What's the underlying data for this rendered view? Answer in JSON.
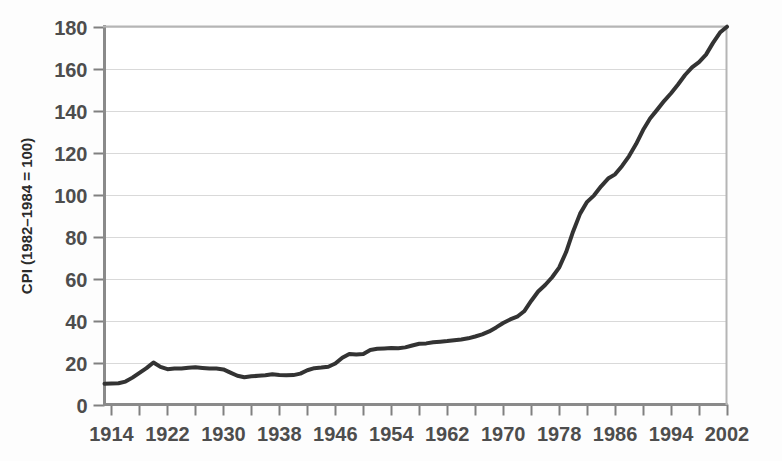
{
  "chart_data": {
    "type": "line",
    "title": "",
    "subtitle": "",
    "xlabel": "",
    "ylabel": "CPI (1982–1984 = 100)",
    "xlim": [
      1913,
      2002
    ],
    "ylim": [
      0,
      180
    ],
    "ytick_step": 20,
    "xtick_step_minor": 4,
    "xtick_step_major": 8,
    "grid": "horizontal",
    "legend": "none",
    "line_color": "#333333",
    "grid_color": "#d9d9d9",
    "axis_color": "#808080",
    "tick_labels": {
      "y": [
        "0",
        "20",
        "40",
        "60",
        "80",
        "100",
        "120",
        "140",
        "160",
        "180"
      ],
      "x": [
        "1914",
        "1922",
        "1930",
        "1938",
        "1946",
        "1954",
        "1962",
        "1970",
        "1978",
        "1986",
        "1994",
        "2002"
      ]
    },
    "x": [
      1913,
      1914,
      1915,
      1916,
      1917,
      1918,
      1919,
      1920,
      1921,
      1922,
      1923,
      1924,
      1925,
      1926,
      1927,
      1928,
      1929,
      1930,
      1931,
      1932,
      1933,
      1934,
      1935,
      1936,
      1937,
      1938,
      1939,
      1940,
      1941,
      1942,
      1943,
      1944,
      1945,
      1946,
      1947,
      1948,
      1949,
      1950,
      1951,
      1952,
      1953,
      1954,
      1955,
      1956,
      1957,
      1958,
      1959,
      1960,
      1961,
      1962,
      1963,
      1964,
      1965,
      1966,
      1967,
      1968,
      1969,
      1970,
      1971,
      1972,
      1973,
      1974,
      1975,
      1976,
      1977,
      1978,
      1979,
      1980,
      1981,
      1982,
      1983,
      1984,
      1985,
      1986,
      1987,
      1988,
      1989,
      1990,
      1991,
      1992,
      1993,
      1994,
      1995,
      1996,
      1997,
      1998,
      1999,
      2000,
      2001,
      2002
    ],
    "values": [
      9.9,
      10.0,
      10.1,
      10.9,
      12.8,
      15.1,
      17.3,
      20.0,
      17.9,
      16.8,
      17.1,
      17.1,
      17.5,
      17.7,
      17.4,
      17.1,
      17.1,
      16.7,
      15.2,
      13.7,
      13.0,
      13.4,
      13.7,
      13.9,
      14.4,
      14.1,
      13.9,
      14.0,
      14.7,
      16.3,
      17.3,
      17.6,
      18.0,
      19.5,
      22.3,
      24.1,
      23.8,
      24.1,
      26.0,
      26.5,
      26.7,
      26.9,
      26.8,
      27.2,
      28.1,
      28.9,
      29.1,
      29.6,
      29.9,
      30.2,
      30.6,
      31.0,
      31.5,
      32.4,
      33.4,
      34.8,
      36.7,
      38.8,
      40.5,
      41.8,
      44.4,
      49.3,
      53.8,
      56.9,
      60.6,
      65.2,
      72.6,
      82.4,
      90.9,
      96.5,
      99.6,
      103.9,
      107.6,
      109.6,
      113.6,
      118.3,
      124.0,
      130.7,
      136.2,
      140.3,
      144.5,
      148.2,
      152.4,
      156.9,
      160.5,
      163.0,
      166.6,
      172.2,
      177.1,
      179.9
    ]
  }
}
